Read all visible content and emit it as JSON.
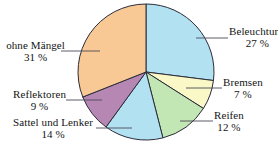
{
  "chart_data": {
    "type": "pie",
    "title": "",
    "subtitle": "",
    "xlabel": "",
    "ylabel": "",
    "legend_position": "none",
    "grid": false,
    "unit": "%",
    "start_angle_deg": 0,
    "direction": "clockwise",
    "categories": [
      "Beleuchtung",
      "Bremsen",
      "Reifen",
      "Sattel und Lenker",
      "Reflektoren",
      "ohne Mängel"
    ],
    "values": [
      27,
      7,
      12,
      14,
      9,
      31
    ],
    "colors": [
      "#b2e2f2",
      "#f9f8c6",
      "#c3e7b4",
      "#b2e2f2",
      "#b787b3",
      "#f9c995"
    ],
    "outline_color": "#2b2b3a",
    "slices": [
      {
        "label": "Beleuchtung",
        "value": 27,
        "value_text": "27 %",
        "color": "#b2e2f2"
      },
      {
        "label": "Bremsen",
        "value": 7,
        "value_text": "7 %",
        "color": "#f9f8c6"
      },
      {
        "label": "Reifen",
        "value": 12,
        "value_text": "12 %",
        "color": "#c3e7b4"
      },
      {
        "label": "Sattel und Lenker",
        "value": 14,
        "value_text": "14 %",
        "color": "#b2e2f2"
      },
      {
        "label": "Reflektoren",
        "value": 9,
        "value_text": "9 %",
        "color": "#b787b3"
      },
      {
        "label": "ohne Mängel",
        "value": 31,
        "value_text": "31 %",
        "color": "#f9c995"
      }
    ]
  },
  "labels": {
    "beleuchtung": {
      "name": "Beleuchtung",
      "pct": "27 %"
    },
    "bremsen": {
      "name": "Bremsen",
      "pct": "7 %"
    },
    "reifen": {
      "name": "Reifen",
      "pct": "12 %"
    },
    "sattel": {
      "name": "Sattel und Lenker",
      "pct": "14 %"
    },
    "reflektoren": {
      "name": "Reflektoren",
      "pct": "9 %"
    },
    "ohne_maengel": {
      "name": "ohne Mängel",
      "pct": "31 %"
    }
  }
}
